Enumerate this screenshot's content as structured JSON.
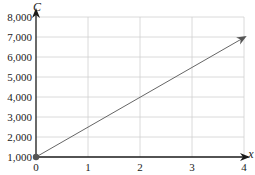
{
  "chart_data": {
    "type": "line",
    "title": "",
    "xlabel": "x",
    "ylabel": "C",
    "x": [
      0,
      4
    ],
    "series": [
      {
        "name": "C",
        "values": [
          1000,
          7000
        ],
        "equation": "C = 1500x + 1000"
      }
    ],
    "xlim": [
      0,
      4
    ],
    "ylim": [
      1000,
      8000
    ],
    "x_ticks": [
      "0",
      "1",
      "2",
      "3",
      "4"
    ],
    "y_ticks": [
      "1,000",
      "2,000",
      "3,000",
      "4,000",
      "5,000",
      "6,000",
      "7,000",
      "8,000"
    ],
    "grid": true,
    "legend": "none",
    "annotations": [
      "filled point at (0, 1,000)",
      "arrowhead at (4, 7,000)"
    ]
  },
  "colors": {
    "axis": "#1a1a1a",
    "grid": "#d0d0d0",
    "line": "#666666",
    "point": "#555555"
  }
}
